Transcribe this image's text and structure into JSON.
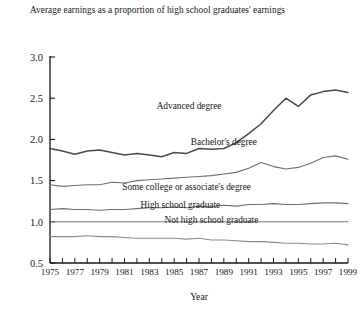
{
  "chart_data": {
    "type": "line",
    "title": "Average earnings as a proportion of high school graduates' earnings",
    "xlabel": "Year",
    "ylabel": "",
    "xlim": [
      1975,
      1999
    ],
    "ylim": [
      0.5,
      3.0
    ],
    "yticks": [
      "0.5",
      "1.0",
      "1.5",
      "2.0",
      "2.5",
      "3.0"
    ],
    "xticks": [
      "1975",
      "1977",
      "1979",
      "1981",
      "1983",
      "1985",
      "1987",
      "1989",
      "1991",
      "1993",
      "1995",
      "1997",
      "1999"
    ],
    "grid": false,
    "legend_position": "inline-labels",
    "x": [
      1975,
      1976,
      1977,
      1978,
      1979,
      1980,
      1981,
      1982,
      1983,
      1984,
      1985,
      1986,
      1987,
      1988,
      1989,
      1990,
      1991,
      1992,
      1993,
      1994,
      1995,
      1996,
      1997,
      1998,
      1999
    ],
    "series": [
      {
        "name": "Advanced degree",
        "color": "#4a4a4a",
        "width": 1.5,
        "values": [
          1.89,
          1.86,
          1.82,
          1.86,
          1.87,
          1.84,
          1.81,
          1.83,
          1.81,
          1.79,
          1.84,
          1.83,
          1.89,
          1.88,
          1.89,
          1.96,
          2.07,
          2.19,
          2.35,
          2.5,
          2.4,
          2.54,
          2.58,
          2.6,
          2.57
        ],
        "label_x": 1986.2,
        "label_y": 2.37
      },
      {
        "name": "Bachelor's degree",
        "color": "#6e6e6e",
        "width": 1.1,
        "values": [
          1.45,
          1.43,
          1.44,
          1.45,
          1.45,
          1.48,
          1.47,
          1.5,
          1.51,
          1.52,
          1.53,
          1.54,
          1.55,
          1.56,
          1.58,
          1.6,
          1.65,
          1.72,
          1.67,
          1.64,
          1.66,
          1.71,
          1.78,
          1.8,
          1.76
        ],
        "label_x": 1989.0,
        "label_y": 1.93
      },
      {
        "name": "Some college or associate's degree",
        "color": "#6e6e6e",
        "width": 1.1,
        "values": [
          1.15,
          1.16,
          1.15,
          1.15,
          1.14,
          1.15,
          1.15,
          1.16,
          1.17,
          1.17,
          1.18,
          1.17,
          1.19,
          1.18,
          1.2,
          1.19,
          1.21,
          1.21,
          1.22,
          1.21,
          1.21,
          1.22,
          1.23,
          1.23,
          1.22
        ],
        "label_x": 1986.0,
        "label_y": 1.39
      },
      {
        "name": "High school graduate",
        "color": "#7a7a7a",
        "width": 1.1,
        "values": [
          1.0,
          1.0,
          1.0,
          1.0,
          1.0,
          1.0,
          1.0,
          1.0,
          1.0,
          1.0,
          1.0,
          1.0,
          1.0,
          1.0,
          1.0,
          1.0,
          1.0,
          1.0,
          1.0,
          1.0,
          1.0,
          1.0,
          1.0,
          1.0,
          1.0
        ],
        "label_x": 1985.5,
        "label_y": 1.17
      },
      {
        "name": "Not high school graduate",
        "color": "#8a8a8a",
        "width": 1.1,
        "values": [
          0.82,
          0.82,
          0.82,
          0.83,
          0.82,
          0.82,
          0.81,
          0.8,
          0.8,
          0.8,
          0.8,
          0.79,
          0.8,
          0.78,
          0.78,
          0.77,
          0.76,
          0.76,
          0.75,
          0.74,
          0.74,
          0.73,
          0.73,
          0.74,
          0.72
        ],
        "label_x": 1988.0,
        "label_y": 0.98
      }
    ]
  }
}
